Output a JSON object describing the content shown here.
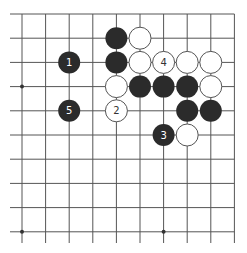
{
  "diagram": {
    "type": "go-board-fragment",
    "view": "top-right corner region",
    "grid": {
      "columns": 10,
      "rows": 10,
      "origin_x": 22,
      "origin_y": 14,
      "spacing_x": 23.6,
      "spacing_y": 24.2,
      "top_edge": true,
      "right_edge": true,
      "left_edge": false,
      "bottom_edge": false,
      "line_color": "#555555"
    },
    "star_points": [
      {
        "col": 0,
        "row": 3
      },
      {
        "col": 0,
        "row": 9
      },
      {
        "col": 6,
        "row": 9
      }
    ],
    "stones": [
      {
        "col": 4,
        "row": 1,
        "color": "black",
        "label": ""
      },
      {
        "col": 5,
        "row": 1,
        "color": "white",
        "label": ""
      },
      {
        "col": 2,
        "row": 2,
        "color": "black",
        "label": "1"
      },
      {
        "col": 4,
        "row": 2,
        "color": "black",
        "label": ""
      },
      {
        "col": 5,
        "row": 2,
        "color": "white",
        "label": ""
      },
      {
        "col": 6,
        "row": 2,
        "color": "white",
        "label": "4"
      },
      {
        "col": 7,
        "row": 2,
        "color": "white",
        "label": ""
      },
      {
        "col": 8,
        "row": 2,
        "color": "white",
        "label": ""
      },
      {
        "col": 4,
        "row": 3,
        "color": "white",
        "label": ""
      },
      {
        "col": 5,
        "row": 3,
        "color": "black",
        "label": ""
      },
      {
        "col": 6,
        "row": 3,
        "color": "black",
        "label": ""
      },
      {
        "col": 7,
        "row": 3,
        "color": "black",
        "label": ""
      },
      {
        "col": 8,
        "row": 3,
        "color": "white",
        "label": ""
      },
      {
        "col": 2,
        "row": 4,
        "color": "black",
        "label": "5"
      },
      {
        "col": 4,
        "row": 4,
        "color": "white",
        "label": "2"
      },
      {
        "col": 7,
        "row": 4,
        "color": "black",
        "label": ""
      },
      {
        "col": 8,
        "row": 4,
        "color": "black",
        "label": ""
      },
      {
        "col": 6,
        "row": 5,
        "color": "black",
        "label": "3"
      },
      {
        "col": 7,
        "row": 5,
        "color": "white",
        "label": ""
      }
    ],
    "colors": {
      "black_stone": "#2b2b2b",
      "white_stone": "#ffffff",
      "white_stone_border": "#555555",
      "black_label": "#ffffff",
      "white_label": "#333333"
    }
  }
}
